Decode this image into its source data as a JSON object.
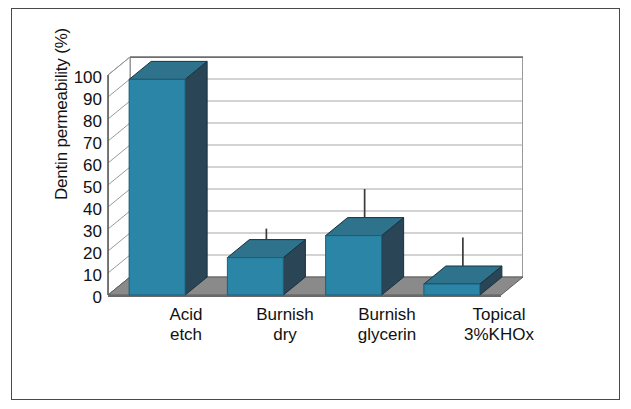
{
  "chart_data": {
    "type": "bar",
    "title": "",
    "subtitle": "",
    "xlabel": "",
    "ylabel": "Dentin permeability (%)",
    "ylim": [
      0,
      100
    ],
    "yticks": [
      0,
      10,
      20,
      30,
      40,
      50,
      60,
      70,
      80,
      90,
      100
    ],
    "ytick_labels": [
      "0",
      "10",
      "20",
      "30",
      "40",
      "50",
      "60",
      "70",
      "80",
      "90",
      "100"
    ],
    "grid": "horizontal",
    "legend": "none",
    "style": "3d-column",
    "categories": [
      "Acid etch",
      "Burnish dry",
      "Burnish glycerin",
      "Topical 3%KHOx"
    ],
    "category_lines": [
      [
        "Acid",
        "etch"
      ],
      [
        "Burnish",
        "dry"
      ],
      [
        "Burnish",
        "glycerin"
      ],
      [
        "Topical",
        "3%KHOx"
      ]
    ],
    "values": [
      98,
      17,
      27,
      5
    ],
    "errors_upper": [
      null,
      22,
      40,
      18
    ],
    "series": [
      {
        "name": "Dentin permeability",
        "values": [
          98,
          17,
          27,
          5
        ],
        "errors_upper": [
          null,
          22,
          40,
          18
        ]
      }
    ],
    "colors": {
      "bar_face": "#2a85a6",
      "bar_top": "#2f728c",
      "bar_side": "#2a4556",
      "bar_edge": "#1d5f78",
      "floor": "#7f7f7f",
      "floor_front": "#6a6a6a",
      "gridline": "#a8a8a8",
      "axis": "#6e6e6e",
      "error_bar": "#3a3a3a",
      "frame": "#4a4a4a",
      "text": "#111111",
      "background": "#ffffff"
    }
  },
  "axis": {
    "y_title": "Dentin permeability (%)"
  }
}
